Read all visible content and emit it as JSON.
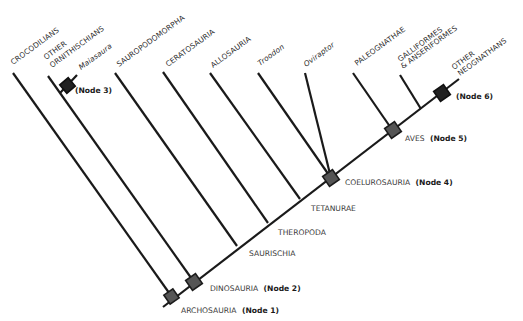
{
  "diagram": {
    "type": "cladogram",
    "taxa": [
      {
        "name": "CROCODILIANS",
        "italic": false
      },
      {
        "name": "OTHER",
        "italic": false
      },
      {
        "name": "ORNITHISCHIANS",
        "italic": false
      },
      {
        "name": "Maiasaura",
        "italic": true
      },
      {
        "name": "SAUROPODOMORPHA",
        "italic": false
      },
      {
        "name": "CERATOSAURIA",
        "italic": false
      },
      {
        "name": "ALLOSAURIA",
        "italic": false
      },
      {
        "name": "Troodon",
        "italic": true
      },
      {
        "name": "Oviraptor",
        "italic": true
      },
      {
        "name": "PALEOGNATHAE",
        "italic": false
      },
      {
        "name": "GALLIFORMES",
        "italic": false
      },
      {
        "name": "& ANSERIFORMES",
        "italic": false
      },
      {
        "name": "OTHER",
        "italic": false
      },
      {
        "name": "NEOGNATHANS",
        "italic": false
      }
    ],
    "clades": {
      "saurischia": "SAURISCHIA",
      "theropoda": "THEROPODA",
      "tetanurae": "TETANURAE"
    },
    "nodes": [
      {
        "name": "ARCHOSAURIA",
        "tag": "(Node 1)"
      },
      {
        "name": "DINOSAURIA",
        "tag": "(Node 2)"
      },
      {
        "name": "",
        "tag": "(Node 3)"
      },
      {
        "name": "COELUROSAURIA",
        "tag": "(Node 4)"
      },
      {
        "name": "AVES",
        "tag": "(Node 5)"
      },
      {
        "name": "",
        "tag": "(Node 6)"
      }
    ]
  }
}
